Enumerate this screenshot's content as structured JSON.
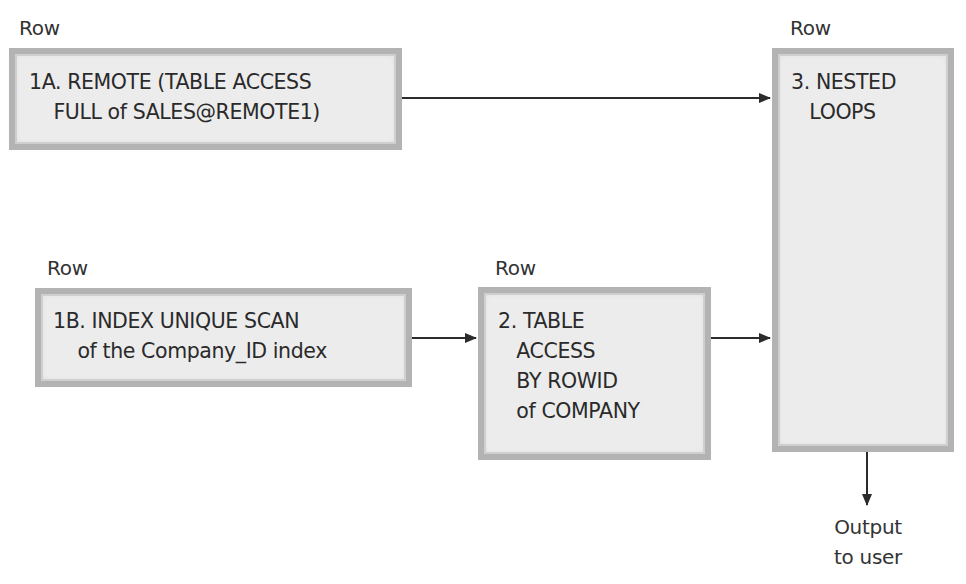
{
  "diagram": {
    "type": "execution-plan-flow",
    "nodes": [
      {
        "id": "1A",
        "row_label": "Row",
        "lines": [
          "1A. REMOTE (TABLE ACCESS",
          "    FULL of SALES@REMOTE1)"
        ]
      },
      {
        "id": "1B",
        "row_label": "Row",
        "lines": [
          "1B. INDEX UNIQUE SCAN",
          "    of the Company_ID index"
        ]
      },
      {
        "id": "2",
        "row_label": "Row",
        "lines": [
          "2. TABLE",
          "   ACCESS",
          "   BY ROWID",
          "   of COMPANY"
        ]
      },
      {
        "id": "3",
        "row_label": "Row",
        "lines": [
          "3. NESTED",
          "   LOOPS"
        ]
      }
    ],
    "edges": [
      {
        "from": "1A",
        "to": "3"
      },
      {
        "from": "1B",
        "to": "2"
      },
      {
        "from": "2",
        "to": "3"
      },
      {
        "from": "3",
        "to": "output"
      }
    ],
    "output": {
      "lines": [
        "Output",
        "to user"
      ]
    }
  },
  "colors": {
    "box_fill": "#ececec",
    "box_border": "#b3b3b3",
    "arrow": "#2b2b2b",
    "text": "#2a2a2a"
  }
}
